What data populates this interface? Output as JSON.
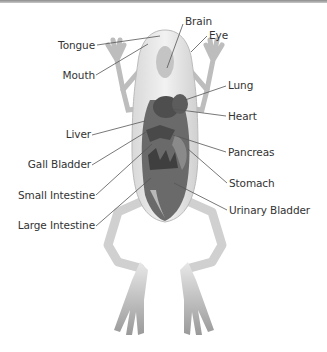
{
  "diagram": {
    "labels_left": [
      {
        "id": "tongue",
        "text": "Tongue"
      },
      {
        "id": "mouth",
        "text": "Mouth"
      },
      {
        "id": "liver",
        "text": "Liver"
      },
      {
        "id": "gall_bladder",
        "text": "Gall Bladder"
      },
      {
        "id": "small_intestine",
        "text": "Small Intestine"
      },
      {
        "id": "large_intestine",
        "text": "Large Intestine"
      }
    ],
    "labels_right": [
      {
        "id": "brain",
        "text": "Brain"
      },
      {
        "id": "eye",
        "text": "Eye"
      },
      {
        "id": "lung",
        "text": "Lung"
      },
      {
        "id": "heart",
        "text": "Heart"
      },
      {
        "id": "pancreas",
        "text": "Pancreas"
      },
      {
        "id": "stomach",
        "text": "Stomach"
      },
      {
        "id": "urinary_bladder",
        "text": "Urinary Bladder"
      }
    ],
    "colors": {
      "line": "#555555",
      "text": "#333333",
      "body": "#e6e6e6",
      "organs": "#5a5a5a"
    }
  }
}
